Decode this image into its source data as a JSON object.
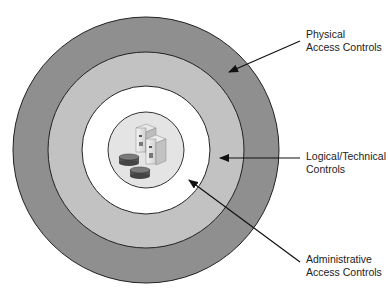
{
  "diagram": {
    "type": "concentric-layers",
    "layers": [
      {
        "id": "physical",
        "label_line1": "Physical",
        "label_line2": "Access Controls",
        "color": "#8f8f8f"
      },
      {
        "id": "logical",
        "label_line1": "Logical/Technical",
        "label_line2": "Controls",
        "color": "#c4c4c4"
      },
      {
        "id": "administrative",
        "label_line1": "Administrative",
        "label_line2": "Access Controls",
        "color": "#ffffff"
      }
    ],
    "core": {
      "description": "servers and databases",
      "color": "#e6e6e6"
    }
  }
}
